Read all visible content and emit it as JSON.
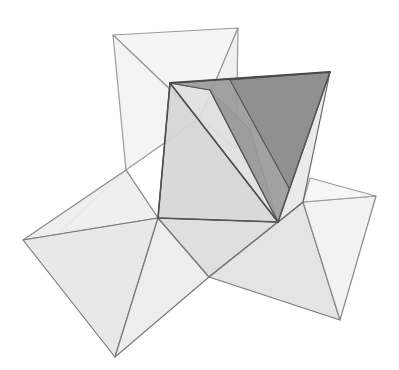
{
  "figure": {
    "colors": {
      "background": "#ffffff",
      "edge_light": "#8a8a8a",
      "edge_dark": "#555555",
      "face_very_light": "#f1f1f1",
      "face_light": "#e4e4e4",
      "face_mid": "#d2d2d2",
      "face_dark": "#a8a8a8",
      "face_darker": "#8f8f8f"
    },
    "faces": [
      {
        "name": "back-square-top",
        "points": "113,35 238,28 200,118",
        "fill": "#f4f4f4",
        "stroke": "#9a9a9a"
      },
      {
        "name": "back-square-left",
        "points": "113,35 200,118 126,170",
        "fill": "#f2f2f2",
        "stroke": "#9a9a9a"
      },
      {
        "name": "back-square-right",
        "points": "238,28 200,118 236,150",
        "fill": "#efefef",
        "stroke": "#9a9a9a"
      },
      {
        "name": "back-lower-left",
        "points": "126,170 158,218 60,232",
        "fill": "#f3f3f3",
        "stroke": "#9a9a9a"
      },
      {
        "name": "left-wing-top",
        "points": "23,240 158,218 126,170",
        "fill": "#eeeeee",
        "stroke": "#8a8a8a"
      },
      {
        "name": "left-wing-main",
        "points": "23,240 158,218 115,357",
        "fill": "#e6e6e6",
        "stroke": "#7a7a7a"
      },
      {
        "name": "left-wing-right",
        "points": "158,218 115,357 209,277",
        "fill": "#ececec",
        "stroke": "#7a7a7a"
      },
      {
        "name": "bottom-center",
        "points": "158,218 278,222 209,277",
        "fill": "#dcdcdc",
        "stroke": "#7a7a7a"
      },
      {
        "name": "right-wing-main",
        "points": "209,277 303,202 340,320",
        "fill": "#e2e2e2",
        "stroke": "#7a7a7a"
      },
      {
        "name": "right-wing-left",
        "points": "209,277 278,222 303,202",
        "fill": "#e4e4e4",
        "stroke": "#7a7a7a"
      },
      {
        "name": "right-wing-right",
        "points": "303,202 376,196 340,320",
        "fill": "#f1f1f1",
        "stroke": "#8a8a8a"
      },
      {
        "name": "right-wing-top",
        "points": "303,202 376,196 310,178",
        "fill": "#f5f5f5",
        "stroke": "#9a9a9a"
      },
      {
        "name": "front-left-face",
        "points": "170,83 158,218 278,222",
        "fill": "#d6d6d6",
        "stroke": "#555555"
      },
      {
        "name": "inner-light-face",
        "points": "170,83 210,90 278,222",
        "fill": "#e0e0e0",
        "stroke": "#666666"
      },
      {
        "name": "inner-sliver",
        "points": "210,90 250,130 278,222",
        "fill": "#bdbdbd",
        "stroke": "#666666"
      },
      {
        "name": "dark-top-face",
        "points": "170,83 330,72 278,222 210,90",
        "fill": "#9a9a9a",
        "stroke": "#555555"
      },
      {
        "name": "dark-right-face",
        "points": "230,80 330,72 290,190",
        "fill": "#8e8e8e",
        "stroke": "#555555"
      },
      {
        "name": "right-edge-face",
        "points": "330,72 278,222 303,202",
        "fill": "#e8e8e8",
        "stroke": "#666666"
      }
    ],
    "edges": [
      {
        "name": "front-diagonal",
        "x1": 170,
        "y1": 83,
        "x2": 278,
        "y2": 222,
        "stroke": "#4f4f4f",
        "width": 1.6
      },
      {
        "name": "front-top-edge",
        "x1": 170,
        "y1": 83,
        "x2": 330,
        "y2": 72,
        "stroke": "#4a4a4a",
        "width": 2
      },
      {
        "name": "front-left-edge",
        "x1": 170,
        "y1": 83,
        "x2": 158,
        "y2": 218,
        "stroke": "#4f4f4f",
        "width": 1.6
      },
      {
        "name": "front-bottom-edge",
        "x1": 158,
        "y1": 218,
        "x2": 278,
        "y2": 222,
        "stroke": "#555555",
        "width": 1.4
      },
      {
        "name": "front-right-edge",
        "x1": 330,
        "y1": 72,
        "x2": 278,
        "y2": 222,
        "stroke": "#555555",
        "width": 1.4
      }
    ]
  }
}
